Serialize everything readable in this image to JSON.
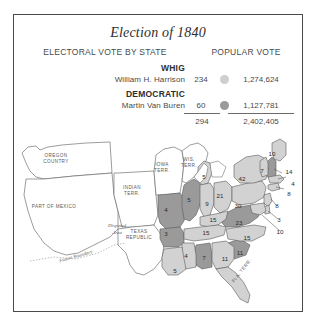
{
  "figure": {
    "title": "Election of 1840",
    "border_color": "#4a4a4a"
  },
  "columns": {
    "electoral_heading": "ELECTORAL VOTE BY STATE",
    "popular_heading": "POPULAR VOTE"
  },
  "parties": [
    {
      "name": "WHIG",
      "candidate": "William H. Harrison",
      "electoral_votes": "234",
      "popular_votes": "1,274,624",
      "color": "#cfcfcf",
      "swatch_name": "whig-color-swatch"
    },
    {
      "name": "DEMOCRATIC",
      "candidate": "Martin Van Buren",
      "electoral_votes": "60",
      "popular_votes": "1,127,781",
      "color": "#9a9a9a",
      "swatch_name": "democratic-color-swatch"
    }
  ],
  "totals": {
    "electoral": "294",
    "popular": "2,402,405"
  },
  "map": {
    "territories": [
      {
        "label": "OREGON\nCOUNTRY",
        "x": 42,
        "y": 26
      },
      {
        "label": "PART OF MEXICO",
        "x": 40,
        "y": 74
      },
      {
        "label": "INDIAN\nTERR.",
        "x": 118,
        "y": 58
      },
      {
        "label": "IOWA\nTERR.",
        "x": 148,
        "y": 35
      },
      {
        "label": "WIS.\nTERR.",
        "x": 175,
        "y": 30
      },
      {
        "label": "TEXAS\nREPUBLIC",
        "x": 125,
        "y": 102
      },
      {
        "label": "FLA. TERR.",
        "x": 228,
        "y": 138,
        "rotate": -52
      }
    ],
    "notes": [
      {
        "label": "Disputed\nArea",
        "x": 103,
        "y": 96
      },
      {
        "label": "Future Boundary",
        "x": 62,
        "y": 124,
        "rotate": -16
      }
    ],
    "states": [
      {
        "name": "Maine",
        "abbr": "ME",
        "votes": "10",
        "party": "whig",
        "x": 258,
        "y": 20
      },
      {
        "name": "Vermont",
        "abbr": "VT",
        "votes": "7",
        "party": "whig",
        "x": 248,
        "y": 37
      },
      {
        "name": "New Hampshire",
        "abbr": "NH",
        "votes": "14",
        "party": "democratic",
        "x": 275,
        "y": 38
      },
      {
        "name": "Massachusetts",
        "abbr": "MA",
        "votes": "4",
        "party": "whig",
        "x": 279,
        "y": 50
      },
      {
        "name": "Connecticut",
        "abbr": "CT",
        "votes": "8",
        "party": "whig",
        "x": 275,
        "y": 60
      },
      {
        "name": "New York",
        "abbr": "NY",
        "votes": "42",
        "party": "whig",
        "x": 228,
        "y": 45
      },
      {
        "name": "New Jersey",
        "abbr": "NJ",
        "votes": "8",
        "party": "whig",
        "x": 263,
        "y": 72
      },
      {
        "name": "Pennsylvania",
        "abbr": "PA",
        "votes": "30",
        "party": "whig",
        "x": 224,
        "y": 72
      },
      {
        "name": "Delaware",
        "abbr": "DE",
        "votes": "3",
        "party": "whig",
        "x": 265,
        "y": 86
      },
      {
        "name": "Maryland",
        "abbr": "MD",
        "votes": "10",
        "party": "whig",
        "x": 266,
        "y": 98
      },
      {
        "name": "Ohio",
        "abbr": "OH",
        "votes": "21",
        "party": "whig",
        "x": 206,
        "y": 62
      },
      {
        "name": "Michigan",
        "abbr": "MI",
        "votes": "5",
        "party": "whig",
        "x": 190,
        "y": 43
      },
      {
        "name": "Indiana",
        "abbr": "IN",
        "votes": "9",
        "party": "whig",
        "x": 193,
        "y": 70
      },
      {
        "name": "Illinois",
        "abbr": "IL",
        "votes": "5",
        "party": "democratic",
        "x": 175,
        "y": 66
      },
      {
        "name": "Missouri",
        "abbr": "MO",
        "votes": "4",
        "party": "democratic",
        "x": 152,
        "y": 76
      },
      {
        "name": "Kentucky",
        "abbr": "KY",
        "votes": "15",
        "party": "whig",
        "x": 199,
        "y": 86
      },
      {
        "name": "Tennessee",
        "abbr": "TN",
        "votes": "15",
        "party": "whig",
        "x": 192,
        "y": 99
      },
      {
        "name": "Virginia",
        "abbr": "VA",
        "votes": "23",
        "party": "democratic",
        "x": 225,
        "y": 89
      },
      {
        "name": "North Carolina",
        "abbr": "NC",
        "votes": "15",
        "party": "whig",
        "x": 233,
        "y": 104
      },
      {
        "name": "South Carolina",
        "abbr": "SC",
        "votes": "11",
        "party": "democratic",
        "x": 226,
        "y": 119
      },
      {
        "name": "Georgia",
        "abbr": "GA",
        "votes": "11",
        "party": "whig",
        "x": 211,
        "y": 125
      },
      {
        "name": "Alabama",
        "abbr": "AL",
        "votes": "7",
        "party": "democratic",
        "x": 190,
        "y": 124
      },
      {
        "name": "Mississippi",
        "abbr": "MS",
        "votes": "4",
        "party": "whig",
        "x": 172,
        "y": 122
      },
      {
        "name": "Arkansas",
        "abbr": "AR",
        "votes": "3",
        "party": "democratic",
        "x": 152,
        "y": 100
      },
      {
        "name": "Louisiana",
        "abbr": "LA",
        "votes": "5",
        "party": "whig",
        "x": 161,
        "y": 137
      }
    ]
  },
  "colors": {
    "whig_fill": "#d2d2d2",
    "democratic_fill": "#9a9a9a",
    "territory_fill": "#ffffff",
    "outline": "#5a5a5a"
  }
}
